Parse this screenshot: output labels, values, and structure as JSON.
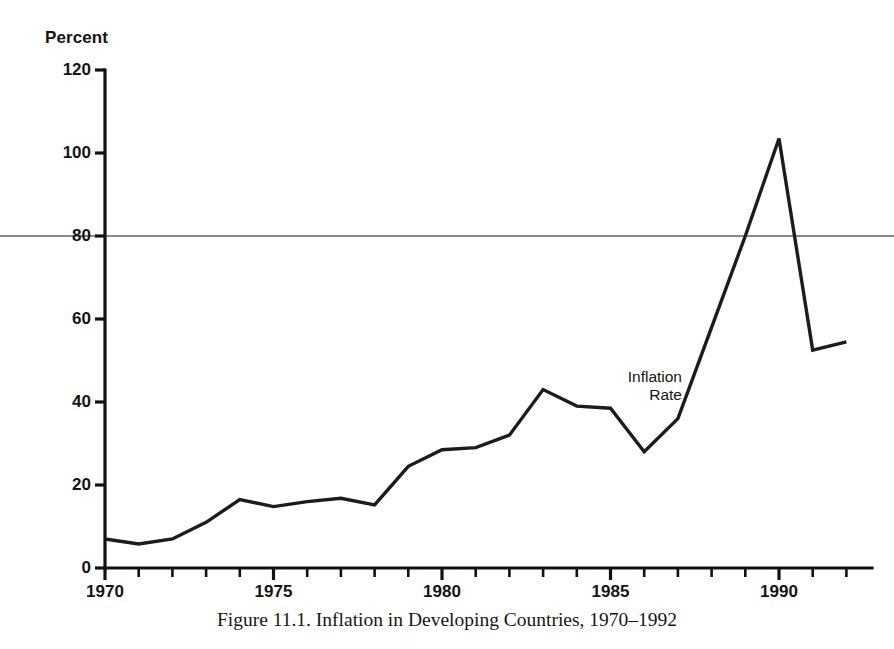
{
  "figure": {
    "caption": "Figure 11.1. Inflation in Developing Countries, 1970–1992",
    "axis_unit_label": "Percent",
    "annotation_line1": "Inflation",
    "annotation_line2": "Rate"
  },
  "colors": {
    "line": "#1c1c1c",
    "axis": "#111111",
    "text": "#141414",
    "gridline": "#8a8a8a",
    "background": "#ffffff"
  },
  "chart_data": {
    "type": "line",
    "title": "Figure 11.1. Inflation in Developing Countries, 1970–1992",
    "xlabel": "",
    "ylabel": "Percent",
    "xlim": [
      1970,
      1992
    ],
    "ylim": [
      0,
      120
    ],
    "grid": false,
    "legend": "none",
    "annotations": [
      {
        "text": "Inflation Rate",
        "x": 1986.2,
        "y": 46
      }
    ],
    "xticks": [
      1970,
      1975,
      1980,
      1985,
      1990
    ],
    "xtick_labels": [
      "1970",
      "1975",
      "1980",
      "1985",
      "1990"
    ],
    "xminor_ticks": [
      1971,
      1972,
      1973,
      1974,
      1976,
      1977,
      1978,
      1979,
      1981,
      1982,
      1983,
      1984,
      1986,
      1987,
      1988,
      1989,
      1991,
      1992
    ],
    "yticks": [
      0,
      20,
      40,
      60,
      80,
      100,
      120
    ],
    "ytick_labels": [
      "0",
      "20",
      "40",
      "60",
      "80",
      "100",
      "120"
    ],
    "reference_line_y": 80,
    "series": [
      {
        "name": "Inflation Rate",
        "x": [
          1970,
          1971,
          1972,
          1973,
          1974,
          1975,
          1976,
          1977,
          1978,
          1979,
          1980,
          1981,
          1982,
          1983,
          1984,
          1985,
          1986,
          1987,
          1988,
          1989,
          1990,
          1991,
          1992
        ],
        "values": [
          7.0,
          5.8,
          7.0,
          11.0,
          16.5,
          14.8,
          16.0,
          16.8,
          15.2,
          24.5,
          28.5,
          29.0,
          32.0,
          43.0,
          39.0,
          38.5,
          28.0,
          36.0,
          58.0,
          80.0,
          103.5,
          52.5,
          54.5
        ]
      }
    ]
  }
}
